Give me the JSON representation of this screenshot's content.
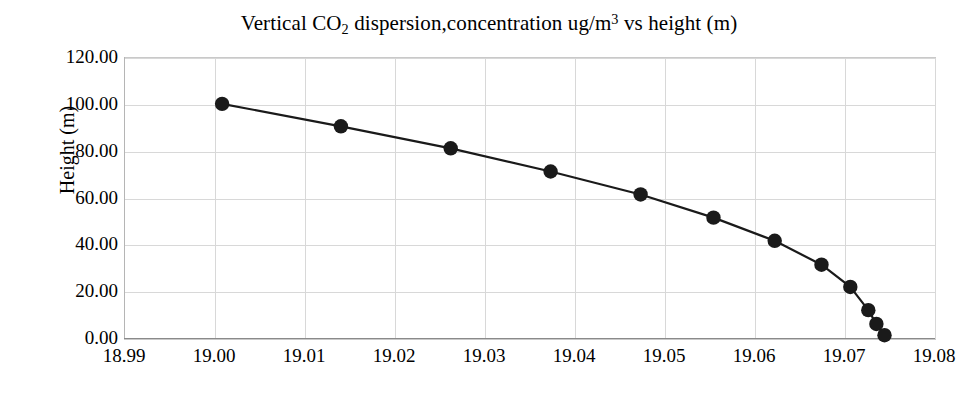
{
  "chart_data": {
    "type": "line",
    "title": "Vertical CO2 dispersion,concentration ug/m3 vs height (m)",
    "title_parts": {
      "before_sub": "Vertical CO",
      "sub": "2",
      "mid": " dispersion,concentration ug/m",
      "sup": "3",
      "after": " vs height (m)"
    },
    "xlabel": "",
    "ylabel": "Height (m)",
    "xlim": [
      18.99,
      19.08
    ],
    "ylim": [
      0.0,
      120.0
    ],
    "xticks": [
      "18.99",
      "19.00",
      "19.01",
      "19.02",
      "19.03",
      "19.04",
      "19.05",
      "19.06",
      "19.07",
      "19.08"
    ],
    "xtick_values": [
      18.99,
      19.0,
      19.01,
      19.02,
      19.03,
      19.04,
      19.05,
      19.06,
      19.07,
      19.08
    ],
    "yticks": [
      "0.00",
      "20.00",
      "40.00",
      "60.00",
      "80.00",
      "100.00",
      "120.00"
    ],
    "ytick_values": [
      0,
      20,
      40,
      60,
      80,
      100,
      120
    ],
    "grid": true,
    "legend": "none",
    "marker": "filled-circle",
    "marker_color": "#1a1a1a",
    "line_color": "#1a1a1a",
    "grid_color": "#d8d8d8",
    "series": [
      {
        "name": "concentration vs height",
        "x": [
          19.0009,
          19.0141,
          19.0263,
          19.0374,
          19.0474,
          19.0555,
          19.0623,
          19.0675,
          19.0707,
          19.0727,
          19.0736,
          19.0745
        ],
        "y": [
          100.0,
          90.4,
          81.0,
          71.1,
          61.3,
          51.4,
          41.5,
          31.3,
          21.8,
          11.9,
          6.0,
          1.2
        ]
      }
    ]
  }
}
